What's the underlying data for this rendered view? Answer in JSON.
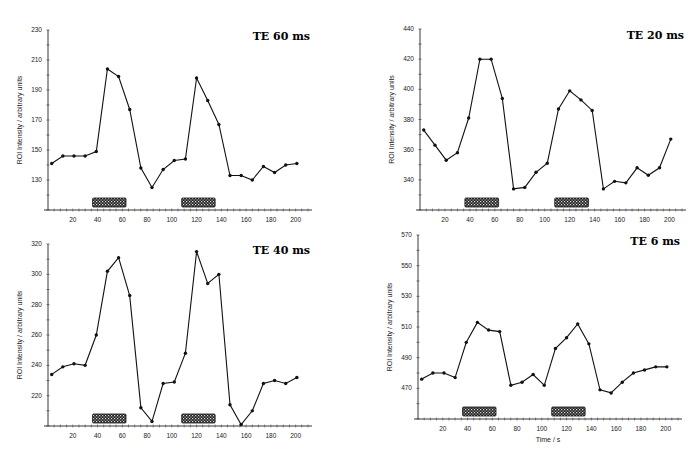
{
  "figure": {
    "caption_fragment": ""
  },
  "chart_data": [
    {
      "type": "line",
      "title": "TE 60 ms",
      "xlabel": "",
      "ylabel": "ROI Intensity / arbitrary units",
      "ylim": [
        110,
        230
      ],
      "yticks": [
        130,
        150,
        170,
        190,
        210,
        230
      ],
      "xlim": [
        0,
        210
      ],
      "xticks": [
        20,
        40,
        60,
        80,
        100,
        120,
        140,
        160,
        180,
        200
      ],
      "stimulus_blocks": [
        [
          36,
          63
        ],
        [
          108,
          135
        ]
      ],
      "x": [
        3,
        12,
        21,
        30,
        39,
        48,
        57,
        66,
        75,
        84,
        93,
        102,
        111,
        120,
        129,
        138,
        147,
        156,
        165,
        174,
        183,
        192,
        201
      ],
      "values": [
        141,
        146,
        146,
        146,
        149,
        204,
        199,
        177,
        138,
        125,
        137,
        143,
        144,
        198,
        183,
        167,
        133,
        133,
        130,
        139,
        135,
        140,
        141
      ]
    },
    {
      "type": "line",
      "title": "TE 20 ms",
      "xlabel": "",
      "ylabel": "ROI Intensity / arbitrary units",
      "ylim": [
        320,
        440
      ],
      "yticks": [
        340,
        360,
        380,
        400,
        420,
        440
      ],
      "xlim": [
        0,
        210
      ],
      "xticks": [
        20,
        40,
        60,
        80,
        100,
        120,
        140,
        160,
        180,
        200
      ],
      "stimulus_blocks": [
        [
          36,
          63
        ],
        [
          108,
          135
        ]
      ],
      "x": [
        3,
        12,
        21,
        30,
        39,
        48,
        57,
        66,
        75,
        84,
        93,
        102,
        111,
        120,
        129,
        138,
        147,
        156,
        165,
        174,
        183,
        192,
        201
      ],
      "values": [
        373,
        363,
        353,
        358,
        381,
        420,
        420,
        394,
        334,
        335,
        345,
        351,
        387,
        399,
        393,
        386,
        334,
        339,
        338,
        348,
        343,
        348,
        367
      ]
    },
    {
      "type": "line",
      "title": "TE 40 ms",
      "xlabel": "",
      "ylabel": "ROI Intensity / arbitrary units",
      "ylim": [
        200,
        320
      ],
      "yticks": [
        220,
        240,
        260,
        280,
        300,
        320
      ],
      "xlim": [
        0,
        210
      ],
      "xticks": [
        20,
        40,
        60,
        80,
        100,
        120,
        140,
        160,
        180,
        200
      ],
      "stimulus_blocks": [
        [
          36,
          63
        ],
        [
          108,
          135
        ]
      ],
      "x": [
        3,
        12,
        21,
        30,
        39,
        48,
        57,
        66,
        75,
        84,
        93,
        102,
        111,
        120,
        129,
        138,
        147,
        156,
        165,
        174,
        183,
        192,
        201
      ],
      "values": [
        234,
        239,
        241,
        240,
        260,
        302,
        311,
        286,
        212,
        203,
        228,
        229,
        248,
        315,
        294,
        300,
        214,
        201,
        210,
        228,
        230,
        228,
        232
      ]
    },
    {
      "type": "line",
      "title": "TE 6 ms",
      "xlabel": "Time / s",
      "ylabel": "ROI Intensity / arbitrary units",
      "ylim": [
        450,
        570
      ],
      "yticks": [
        470,
        490,
        510,
        530,
        550,
        570
      ],
      "xlim": [
        0,
        210
      ],
      "xticks": [
        20,
        40,
        60,
        80,
        100,
        120,
        140,
        160,
        180,
        200
      ],
      "stimulus_blocks": [
        [
          36,
          63
        ],
        [
          108,
          135
        ]
      ],
      "x": [
        3,
        12,
        21,
        30,
        39,
        48,
        57,
        66,
        75,
        84,
        93,
        102,
        111,
        120,
        129,
        138,
        147,
        156,
        165,
        174,
        183,
        192,
        201
      ],
      "values": [
        476,
        480,
        480,
        477,
        500,
        513,
        508,
        507,
        472,
        474,
        479,
        472,
        496,
        503,
        512,
        499,
        469,
        467,
        474,
        480,
        482,
        484,
        484
      ]
    }
  ]
}
